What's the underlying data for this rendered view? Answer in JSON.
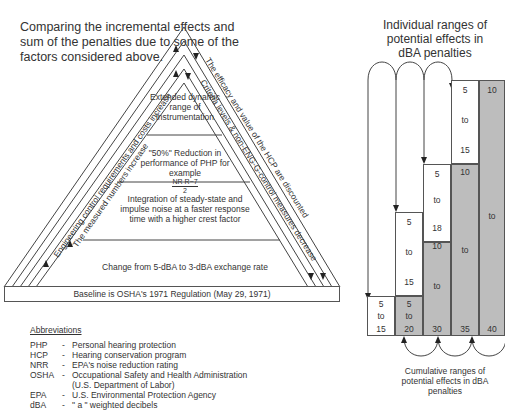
{
  "title": "Comparing the incremental effects and sum of the penalties due to some of the factors considered above.",
  "triangle": {
    "tiers": [
      {
        "label": "Extended dynamic range of instrumentation"
      },
      {
        "label": "\"50%\" Reduction in performance of PHP for example",
        "formula_num": "NR R−7",
        "formula_den": "2"
      },
      {
        "label": "Integration of steady-state and impulse noise at a faster response time with a higher crest factor"
      },
      {
        "label": "Change from 5-dBA to 3-dBA exchange rate"
      }
    ],
    "baseline": "Baseline is OSHA's 1971 Regulation (May 29, 1971)",
    "left_side_outer": "Engineering control requirements and costs increase",
    "left_side_inner": "The measured numbers increase",
    "right_side_outer": "The efficacy and value of the HCP are discounted",
    "right_side_inner": "Criteria levels & non-ENG-G-control measures decrease"
  },
  "abbreviations": {
    "heading": "Abbreviations",
    "items": [
      {
        "key": "PHP",
        "sep": "-",
        "desc": "Personal hearing protection"
      },
      {
        "key": "HCP",
        "sep": "-",
        "desc": "Hearing conservation program"
      },
      {
        "key": "NRR",
        "sep": "-",
        "desc": "EPA's noise reduction rating"
      },
      {
        "key": "OSHA",
        "sep": "-",
        "desc": "Occupational Safety and Health Administration"
      },
      {
        "key": "",
        "sep": "",
        "desc": "(U.S. Department of Labor)"
      },
      {
        "key": "EPA",
        "sep": "-",
        "desc": "U.S. Environmental Protection Agency"
      },
      {
        "key": "dBA",
        "sep": "-",
        "desc": "\" a \" weighted decibels"
      }
    ]
  },
  "right_chart": {
    "title": "Individual ranges of potential effects in dBA penalties",
    "bottom_caption": "Cumulative ranges of potential effects in dBA penalties",
    "individual": [
      {
        "from": "5",
        "to_word": "to",
        "to": "15"
      },
      {
        "from": "5",
        "to_word": "to",
        "to": "15"
      },
      {
        "from": "5",
        "to_word": "to",
        "to": "18"
      },
      {
        "from": "5",
        "to_word": "to",
        "to": "15"
      }
    ],
    "cumulative": [
      {
        "from": "5",
        "to_word": "to",
        "to": "15"
      },
      {
        "from": "5",
        "to_word": "to",
        "to": "20"
      },
      {
        "from": "10",
        "to_word": "to",
        "to": "30"
      },
      {
        "from": "10",
        "to_word": "to",
        "to": "35"
      },
      {
        "from": "10",
        "to_word": "to",
        "to": "40"
      }
    ]
  }
}
